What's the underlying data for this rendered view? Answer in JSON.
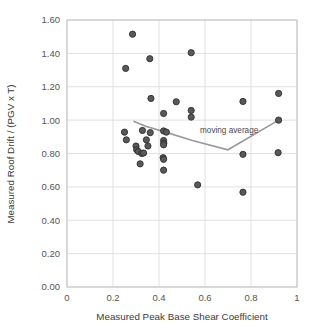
{
  "chart_data": {
    "type": "scatter",
    "title": "",
    "xlabel": "Measured Peak Base Shear Coefficient",
    "ylabel": "Measured Roof Drift / (PGV x T)",
    "xlim": [
      0,
      1
    ],
    "ylim": [
      0.0,
      1.6
    ],
    "xticks": [
      "0",
      "0.2",
      "0.4",
      "0.6",
      "0.8",
      "1"
    ],
    "xtick_values": [
      0,
      0.2,
      0.4,
      0.6,
      0.8,
      1
    ],
    "yticks": [
      "0.00",
      "0.20",
      "0.40",
      "0.60",
      "0.80",
      "1.00",
      "1.20",
      "1.40",
      "1.60"
    ],
    "ytick_values": [
      0.0,
      0.2,
      0.4,
      0.6,
      0.8,
      1.0,
      1.2,
      1.4,
      1.6
    ],
    "grid": true,
    "legend": "none",
    "marker_color": "#595959",
    "marker_edge_color": "#2f2f2f",
    "line_color": "#9a9a9a",
    "grid_color": "#d9d9d9",
    "axis_color": "#c0c0c0",
    "background": "#ffffff",
    "series": [
      {
        "name": "Measured data",
        "type": "scatter",
        "points": [
          [
            0.285,
            1.515
          ],
          [
            0.255,
            1.31
          ],
          [
            0.36,
            1.368
          ],
          [
            0.54,
            1.404
          ],
          [
            0.365,
            1.13
          ],
          [
            0.475,
            1.11
          ],
          [
            0.765,
            1.112
          ],
          [
            0.92,
            1.16
          ],
          [
            0.42,
            1.04
          ],
          [
            0.54,
            1.058
          ],
          [
            0.54,
            1.018
          ],
          [
            0.92,
            1.0
          ],
          [
            0.25,
            0.928
          ],
          [
            0.258,
            0.882
          ],
          [
            0.328,
            0.938
          ],
          [
            0.362,
            0.925
          ],
          [
            0.345,
            0.882
          ],
          [
            0.42,
            0.935
          ],
          [
            0.432,
            0.928
          ],
          [
            0.3,
            0.845
          ],
          [
            0.303,
            0.822
          ],
          [
            0.31,
            0.812
          ],
          [
            0.325,
            0.8
          ],
          [
            0.333,
            0.803
          ],
          [
            0.352,
            0.845
          ],
          [
            0.42,
            0.878
          ],
          [
            0.421,
            0.862
          ],
          [
            0.42,
            0.852
          ],
          [
            0.318,
            0.738
          ],
          [
            0.418,
            0.775
          ],
          [
            0.42,
            0.765
          ],
          [
            0.42,
            0.7
          ],
          [
            0.765,
            0.795
          ],
          [
            0.918,
            0.805
          ],
          [
            0.568,
            0.612
          ],
          [
            0.765,
            0.568
          ]
        ]
      },
      {
        "name": "moving average",
        "type": "line",
        "label": "moving average",
        "label_x": 0.705,
        "label_y": 0.925,
        "points": [
          [
            0.292,
            0.992
          ],
          [
            0.345,
            0.962
          ],
          [
            0.425,
            0.93
          ],
          [
            0.545,
            0.878
          ],
          [
            0.7,
            0.822
          ],
          [
            0.92,
            1.0
          ]
        ]
      }
    ]
  }
}
